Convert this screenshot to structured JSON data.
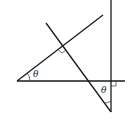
{
  "diagram": {
    "angle_labels": [
      "θ",
      "θ"
    ],
    "right_angle_marks": 2,
    "stroke_color": "#1a1a1a",
    "background": "#ffffff"
  }
}
